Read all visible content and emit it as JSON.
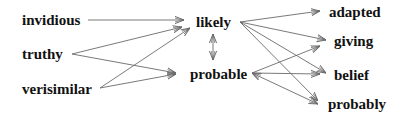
{
  "diagram": {
    "type": "word-association-graph",
    "colors": {
      "text": "#111111",
      "edge": "#6a6a6a",
      "background": "#ffffff"
    },
    "nodes": {
      "invidious": {
        "label": "invidious",
        "x": 22,
        "y": 25
      },
      "truthy": {
        "label": "truthy",
        "x": 22,
        "y": 59
      },
      "verisimilar": {
        "label": "verisimilar",
        "x": 22,
        "y": 94
      },
      "likely": {
        "label": "likely",
        "x": 196,
        "y": 27
      },
      "probable": {
        "label": "probable",
        "x": 190,
        "y": 79
      },
      "adapted": {
        "label": "adapted",
        "x": 329,
        "y": 17
      },
      "giving": {
        "label": "giving",
        "x": 334,
        "y": 46
      },
      "belief": {
        "label": "belief",
        "x": 334,
        "y": 80
      },
      "probably": {
        "label": "probably",
        "x": 328,
        "y": 109
      }
    },
    "edges": [
      {
        "from": "invidious",
        "to": "likely",
        "x1": 88,
        "y1": 20,
        "x2": 184,
        "y2": 20,
        "bidirectional": false
      },
      {
        "from": "truthy",
        "to": "likely",
        "x1": 72,
        "y1": 54,
        "x2": 182,
        "y2": 27,
        "bidirectional": false
      },
      {
        "from": "truthy",
        "to": "probable",
        "x1": 72,
        "y1": 54,
        "x2": 176,
        "y2": 73,
        "bidirectional": false
      },
      {
        "from": "verisimilar",
        "to": "likely",
        "x1": 100,
        "y1": 88,
        "x2": 190,
        "y2": 28,
        "bidirectional": false
      },
      {
        "from": "verisimilar",
        "to": "probable",
        "x1": 100,
        "y1": 88,
        "x2": 176,
        "y2": 74,
        "bidirectional": false
      },
      {
        "from": "likely",
        "to": "probable",
        "x1": 213,
        "y1": 34,
        "x2": 213,
        "y2": 60,
        "bidirectional": true
      },
      {
        "from": "likely",
        "to": "adapted",
        "x1": 240,
        "y1": 22,
        "x2": 320,
        "y2": 11,
        "bidirectional": false
      },
      {
        "from": "likely",
        "to": "giving",
        "x1": 240,
        "y1": 22,
        "x2": 326,
        "y2": 40,
        "bidirectional": false
      },
      {
        "from": "likely",
        "to": "belief",
        "x1": 240,
        "y1": 22,
        "x2": 326,
        "y2": 73,
        "bidirectional": false
      },
      {
        "from": "likely",
        "to": "probably",
        "x1": 240,
        "y1": 22,
        "x2": 318,
        "y2": 101,
        "bidirectional": false
      },
      {
        "from": "probable",
        "to": "giving",
        "x1": 252,
        "y1": 73,
        "x2": 320,
        "y2": 46,
        "bidirectional": false
      },
      {
        "from": "probable",
        "to": "belief",
        "x1": 252,
        "y1": 73,
        "x2": 320,
        "y2": 74,
        "bidirectional": false
      },
      {
        "from": "probable",
        "to": "probably",
        "x1": 252,
        "y1": 73,
        "x2": 318,
        "y2": 104,
        "bidirectional": true
      }
    ]
  }
}
